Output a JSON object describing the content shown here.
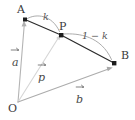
{
  "figure": {
    "kind": "vector-geometry-diagram",
    "width": 135,
    "height": 120,
    "background_color": "#ffffff",
    "points": {
      "O": {
        "label": "O",
        "x": 18,
        "y": 103,
        "dot": false
      },
      "A": {
        "label": "A",
        "x": 25,
        "y": 19,
        "dot": true
      },
      "P": {
        "label": "P",
        "x": 61,
        "y": 35,
        "dot": true
      },
      "B": {
        "label": "B",
        "x": 114,
        "y": 63,
        "dot": true
      }
    },
    "vectors": [
      {
        "name": "a",
        "label": "a",
        "from": "O",
        "to": "A",
        "color": "#b0b0b0",
        "accent": "arrow"
      },
      {
        "name": "p",
        "label": "p",
        "from": "O",
        "to": "P",
        "color": "#d2d2d2",
        "accent": "arrow"
      },
      {
        "name": "b",
        "label": "b",
        "from": "O",
        "to": "B",
        "color": "#a8a8a8",
        "accent": "arrow"
      }
    ],
    "segments": [
      {
        "name": "AP",
        "from": "A",
        "to": "P",
        "color": "#2b2b2b"
      },
      {
        "name": "PB",
        "from": "P",
        "to": "B",
        "color": "#2b2b2b"
      }
    ],
    "ratio_arcs": [
      {
        "name": "k-arc",
        "label": "k",
        "spans": "A to P",
        "color": "#9a9a9a"
      },
      {
        "name": "one-minus-k-arc",
        "label": "1 − k",
        "spans": "P to B",
        "color": "#9a9a9a"
      }
    ],
    "labels": {
      "point_A": "A",
      "point_P": "P",
      "point_B": "B",
      "point_O": "O",
      "scalar_k": "k",
      "scalar_one_minus_k": "1 − k",
      "vector_a": "a",
      "vector_p": "p",
      "vector_b": "b"
    },
    "colors": {
      "segment": "#2b2b2b",
      "vector_a": "#b0b0b0",
      "vector_p": "#d2d2d2",
      "vector_b": "#a8a8a8",
      "arc": "#9a9a9a",
      "text": "#3a3a3a"
    }
  }
}
